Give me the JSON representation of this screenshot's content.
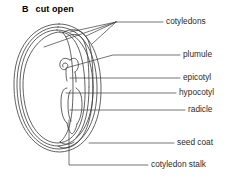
{
  "figure": {
    "panel_letter": "B",
    "panel_title": "cut open",
    "line_color": "#3a3a3a",
    "text_color": "#2b2b2b",
    "background_color": "#ffffff"
  },
  "labels": {
    "cotyledons": "cotyledons",
    "plumule": "plumule",
    "epicotyl": "epicotyl",
    "hypocotyl": "hypocotyl",
    "radicle": "radicle",
    "seed_coat": "seed coat",
    "cotyledon_stalk": "cotyledon stalk"
  },
  "diagram_parts": [
    {
      "name": "seed-coat-outer",
      "label": "seed coat"
    },
    {
      "name": "cotyledon-large",
      "label": "cotyledons"
    },
    {
      "name": "cotyledon-side",
      "label": "cotyledons"
    },
    {
      "name": "plumule-coil",
      "label": "plumule"
    },
    {
      "name": "epicotyl-segment",
      "label": "epicotyl"
    },
    {
      "name": "hypocotyl-segment",
      "label": "hypocotyl"
    },
    {
      "name": "radicle-tip",
      "label": "radicle"
    },
    {
      "name": "cotyledon-stalk-join",
      "label": "cotyledon stalk"
    }
  ]
}
